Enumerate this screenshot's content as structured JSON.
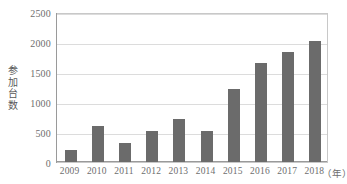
{
  "chart_data": {
    "type": "bar",
    "title": "",
    "subtitle": "",
    "xlabel": "",
    "ylabel": "参加台数",
    "x_unit_label": "（年）",
    "categories": [
      "2009",
      "2010",
      "2011",
      "2012",
      "2013",
      "2014",
      "2015",
      "2016",
      "2017",
      "2018"
    ],
    "values": [
      200,
      600,
      310,
      510,
      715,
      515,
      1220,
      1650,
      1835,
      2020
    ],
    "ylim": [
      0,
      2500
    ],
    "y_ticks": [
      0,
      500,
      1000,
      1500,
      2000,
      2500
    ],
    "y_tick_labels": [
      "0",
      "500",
      "1000",
      "1500",
      "2000",
      "2500"
    ],
    "grid": true,
    "grid_axis": "y",
    "legend": false,
    "legend_position": "none",
    "series": [
      {
        "name": "参加台数",
        "color": "#6b6b6b",
        "values": [
          200,
          600,
          310,
          510,
          715,
          515,
          1220,
          1650,
          1835,
          2020
        ]
      }
    ],
    "annotations": []
  },
  "colors": {
    "bar": "#6b6b6b",
    "gridline": "#dcdcdc",
    "axis": "#9a9a9a",
    "plot_border": "#c8c8c8",
    "text": "#6e6e6e",
    "background": "#ffffff"
  }
}
